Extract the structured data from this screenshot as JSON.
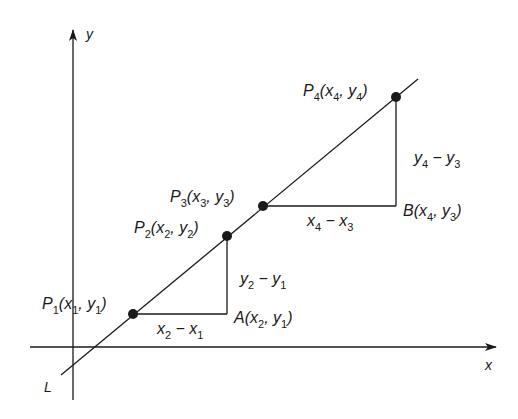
{
  "diagram": {
    "type": "slope-of-line",
    "axes": {
      "x_label": "x",
      "y_label": "y"
    },
    "line_label": "L",
    "points": [
      {
        "id": "P1",
        "name": "P",
        "sub": "1",
        "coords": "(x1, y1)",
        "cx": 133,
        "cy": 314
      },
      {
        "id": "P2",
        "name": "P",
        "sub": "2",
        "coords": "(x2, y2)",
        "cx": 227,
        "cy": 236
      },
      {
        "id": "P3",
        "name": "P",
        "sub": "3",
        "coords": "(x3, y3)",
        "cx": 263,
        "cy": 206
      },
      {
        "id": "P4",
        "name": "P",
        "sub": "4",
        "coords": "(x4, y4)",
        "cx": 396,
        "cy": 97
      }
    ],
    "corner_points": [
      {
        "id": "A",
        "name": "A",
        "coords": "(x2, y1)"
      },
      {
        "id": "B",
        "name": "B",
        "coords": "(x4, y3)"
      }
    ],
    "differences": {
      "run_1": "x2 − x1",
      "rise_1": "y2 − y1",
      "run_2": "x4 − x3",
      "rise_2": "y4 − y3"
    },
    "colors": {
      "ink": "#1a1a1a",
      "background": "#ffffff"
    }
  }
}
